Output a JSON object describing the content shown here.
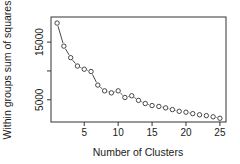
{
  "chart_data": {
    "type": "line",
    "style": "points-with-line-segments",
    "title": "",
    "xlabel": "Number of Clusters",
    "ylabel": "Within groups sum of squares",
    "x": [
      1,
      2,
      3,
      4,
      5,
      6,
      7,
      8,
      9,
      10,
      11,
      12,
      13,
      14,
      15,
      16,
      17,
      18,
      19,
      20,
      21,
      22,
      23,
      24,
      25
    ],
    "series": [
      {
        "name": "wss",
        "values": [
          18300,
          14300,
          12300,
          10850,
          10300,
          9900,
          7550,
          6550,
          6200,
          6550,
          5400,
          5700,
          4900,
          4350,
          4000,
          3850,
          3600,
          3300,
          3000,
          2850,
          2600,
          2400,
          2250,
          2050,
          1800
        ]
      }
    ],
    "xticks": [
      5,
      10,
      15,
      20,
      25
    ],
    "xtick_labels": [
      "5",
      "10",
      "15",
      "20",
      "25"
    ],
    "yticks": [
      5000,
      10000,
      15000
    ],
    "ytick_labels": [
      "5000",
      "",
      "15000"
    ],
    "xlim": [
      0.1,
      25.9
    ],
    "ylim": [
      1150,
      19350
    ],
    "grid": false,
    "legend": "none",
    "colors": {
      "points": "#333333",
      "line": "#333333",
      "frame": "#333333"
    }
  }
}
